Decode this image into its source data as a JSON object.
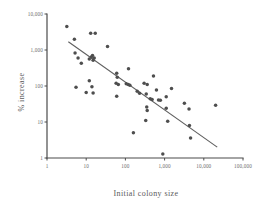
{
  "chart_data": {
    "type": "scatter",
    "title": "",
    "xlabel": "Initial colony size",
    "ylabel": "% increase",
    "xscale": "log",
    "yscale": "log",
    "xlim": [
      1,
      100000
    ],
    "ylim": [
      1,
      10000
    ],
    "grid": false,
    "legend": null,
    "xticks": [
      1,
      10,
      100,
      1000,
      10000,
      100000
    ],
    "xtick_labels": [
      "1",
      "10",
      "100",
      "1,000",
      "10,000",
      "100,000"
    ],
    "yticks": [
      1,
      10,
      100,
      1000,
      10000
    ],
    "ytick_labels": [
      "1",
      "10",
      "100",
      "1,000",
      "10,000"
    ],
    "marker": "filled-circle",
    "marker_color": "#4e4e4e",
    "points": [
      {
        "x": 3.2,
        "y": 4500
      },
      {
        "x": 5.0,
        "y": 2000
      },
      {
        "x": 13.0,
        "y": 2900
      },
      {
        "x": 17.0,
        "y": 2900
      },
      {
        "x": 35.0,
        "y": 1250
      },
      {
        "x": 5.2,
        "y": 820
      },
      {
        "x": 6.2,
        "y": 600
      },
      {
        "x": 7.5,
        "y": 430
      },
      {
        "x": 12.0,
        "y": 560
      },
      {
        "x": 13.5,
        "y": 640
      },
      {
        "x": 14.5,
        "y": 700
      },
      {
        "x": 15.0,
        "y": 520
      },
      {
        "x": 16.0,
        "y": 600
      },
      {
        "x": 5.5,
        "y": 92
      },
      {
        "x": 12.0,
        "y": 140
      },
      {
        "x": 14.0,
        "y": 95
      },
      {
        "x": 10.0,
        "y": 66
      },
      {
        "x": 15.0,
        "y": 64
      },
      {
        "x": 60.0,
        "y": 225
      },
      {
        "x": 62.0,
        "y": 175
      },
      {
        "x": 120.0,
        "y": 300
      },
      {
        "x": 58.0,
        "y": 120
      },
      {
        "x": 66.0,
        "y": 110
      },
      {
        "x": 105.0,
        "y": 115
      },
      {
        "x": 118.0,
        "y": 110
      },
      {
        "x": 130.0,
        "y": 105
      },
      {
        "x": 60.0,
        "y": 52
      },
      {
        "x": 200.0,
        "y": 72
      },
      {
        "x": 230.0,
        "y": 63
      },
      {
        "x": 300.0,
        "y": 120
      },
      {
        "x": 360.0,
        "y": 110
      },
      {
        "x": 520.0,
        "y": 190
      },
      {
        "x": 340.0,
        "y": 60
      },
      {
        "x": 430.0,
        "y": 44
      },
      {
        "x": 480.0,
        "y": 42
      },
      {
        "x": 620.0,
        "y": 78
      },
      {
        "x": 700.0,
        "y": 41
      },
      {
        "x": 780.0,
        "y": 40
      },
      {
        "x": 1100.0,
        "y": 50
      },
      {
        "x": 1500.0,
        "y": 85
      },
      {
        "x": 350.0,
        "y": 26
      },
      {
        "x": 360.0,
        "y": 21
      },
      {
        "x": 1100.0,
        "y": 24
      },
      {
        "x": 3200.0,
        "y": 33
      },
      {
        "x": 4200.0,
        "y": 23
      },
      {
        "x": 20000.0,
        "y": 29
      },
      {
        "x": 330.0,
        "y": 11
      },
      {
        "x": 1200.0,
        "y": 10.5
      },
      {
        "x": 4300.0,
        "y": 8
      },
      {
        "x": 160.0,
        "y": 5
      },
      {
        "x": 4600.0,
        "y": 3.6
      },
      {
        "x": 900.0,
        "y": 1.3
      }
    ],
    "trend_line": {
      "style": "solid",
      "color": "#5f5f5f",
      "start": {
        "x": 3.5,
        "y": 1700
      },
      "end": {
        "x": 22000.0,
        "y": 2.0
      }
    }
  }
}
